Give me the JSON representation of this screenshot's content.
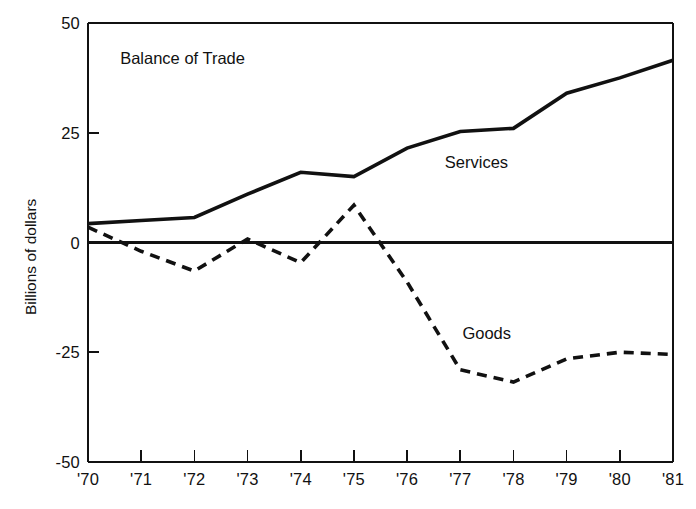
{
  "chart_data": {
    "type": "line",
    "title": "Balance of Trade",
    "xlabel": "",
    "ylabel": "Billions of dollars",
    "x": [
      "'70",
      "'71",
      "'72",
      "'73",
      "'74",
      "'75",
      "'76",
      "'77",
      "'78",
      "'79",
      "'80",
      "'81"
    ],
    "xlim": [
      0,
      11
    ],
    "ylim": [
      -50,
      50
    ],
    "yticks": [
      "50",
      "25",
      "0",
      "-25",
      "-50"
    ],
    "ytick_values": [
      50,
      25,
      0,
      -25,
      -50
    ],
    "grid": false,
    "legend_position": "inline-annotations",
    "series": [
      {
        "name": "Services",
        "style": "solid",
        "values": [
          4.3,
          5.0,
          5.7,
          11.0,
          16.0,
          15.0,
          21.5,
          25.3,
          26.0,
          34.0,
          37.5,
          41.5
        ]
      },
      {
        "name": "Goods",
        "style": "dashed",
        "values": [
          3.5,
          -2.0,
          -6.5,
          0.8,
          -4.6,
          8.5,
          -9.0,
          -29.0,
          -31.8,
          -26.5,
          -25.0,
          -25.5
        ]
      }
    ],
    "annotations": [
      {
        "text": "Balance of Trade",
        "x_frac": 0.055,
        "y_frac": 0.06
      },
      {
        "text": "Services",
        "x_frac": 0.61,
        "y_frac": 0.295
      },
      {
        "text": "Goods",
        "x_frac": 0.64,
        "y_frac": 0.685
      }
    ],
    "colors": {
      "axis": "#111111",
      "series_services": "#111111",
      "series_goods": "#111111",
      "background": "#ffffff"
    }
  }
}
